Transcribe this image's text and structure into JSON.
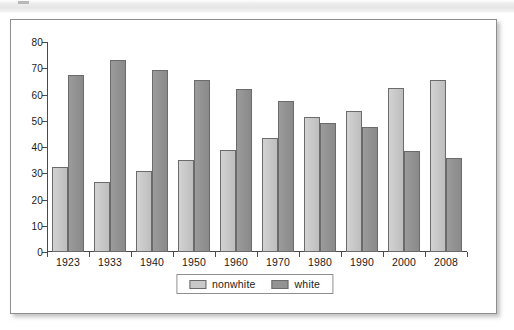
{
  "figure": {
    "card_label": "bar-chart-figure"
  },
  "chart_data": {
    "type": "bar",
    "title": "",
    "subtitle": "",
    "xlabel": "",
    "ylabel": "",
    "ylim": [
      0,
      80
    ],
    "y_ticks": [
      0,
      10,
      20,
      30,
      40,
      50,
      60,
      70,
      80
    ],
    "grid": false,
    "legend_position": "bottom-center",
    "categories": [
      "1923",
      "1933",
      "1940",
      "1950",
      "1960",
      "1970",
      "1980",
      "1990",
      "2000",
      "2008"
    ],
    "series": [
      {
        "name": "nonwhite",
        "color": "#c9c9c9",
        "values": [
          32.3,
          26.8,
          31.0,
          35.1,
          38.7,
          43.5,
          51.4,
          53.7,
          62.6,
          65.7
        ]
      },
      {
        "name": "white",
        "color": "#939393",
        "values": [
          67.5,
          73.3,
          69.2,
          65.4,
          62.1,
          57.6,
          49.3,
          47.5,
          38.6,
          35.9
        ]
      }
    ]
  },
  "legend": {
    "items": [
      {
        "label": "nonwhite",
        "color": "#c9c9c9"
      },
      {
        "label": "white",
        "color": "#939393"
      }
    ]
  }
}
